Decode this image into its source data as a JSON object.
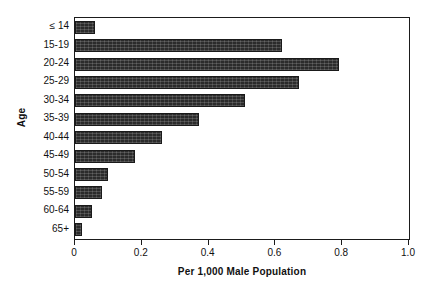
{
  "chart_data": {
    "type": "bar",
    "orientation": "horizontal",
    "title": "",
    "xlabel": "Per 1,000 Male Population",
    "ylabel": "Age",
    "categories": [
      "≤ 14",
      "15-19",
      "20-24",
      "25-29",
      "30-34",
      "35-39",
      "40-44",
      "45-49",
      "50-54",
      "55-59",
      "60-64",
      "65+"
    ],
    "values": [
      0.06,
      0.62,
      0.79,
      0.67,
      0.51,
      0.37,
      0.26,
      0.18,
      0.1,
      0.08,
      0.05,
      0.02
    ],
    "xlim": [
      0,
      1.0
    ],
    "xticks": [
      0,
      0.2,
      0.4,
      0.6,
      0.8,
      1.0
    ],
    "xtick_labels": [
      "0",
      "0.2",
      "0.4",
      "0.6",
      "0.8",
      "1.0"
    ],
    "grid": false,
    "legend": false,
    "bar_color": "#2b2b2b",
    "frame_color": "#1b1b1b",
    "background": "#ffffff"
  }
}
